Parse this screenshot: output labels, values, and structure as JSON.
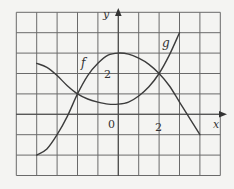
{
  "chart_data": {
    "type": "line",
    "title": "",
    "xlabel": "x",
    "ylabel": "y",
    "xlim": [
      -5,
      5
    ],
    "ylim": [
      -3,
      5
    ],
    "grid": true,
    "grid_step": 1,
    "tick_labels": {
      "origin": "0",
      "x": [
        {
          "value": 2,
          "label": "2"
        }
      ],
      "y": [
        {
          "value": 2,
          "label": "2"
        }
      ]
    },
    "series": [
      {
        "name": "f",
        "label_position": [
          -1.7,
          2.4
        ],
        "points": [
          [
            -4,
            -2
          ],
          [
            -3.5,
            -1.7
          ],
          [
            -3,
            -1
          ],
          [
            -2.5,
            -0.1
          ],
          [
            -2,
            1
          ],
          [
            -1.5,
            1.9
          ],
          [
            -1,
            2.5
          ],
          [
            -0.5,
            2.9
          ],
          [
            0,
            3
          ],
          [
            0.5,
            2.95
          ],
          [
            1,
            2.75
          ],
          [
            1.5,
            2.45
          ],
          [
            2,
            2
          ],
          [
            2.5,
            1.4
          ],
          [
            3,
            0.6
          ],
          [
            3.5,
            -0.2
          ],
          [
            4,
            -1
          ]
        ]
      },
      {
        "name": "g",
        "label_position": [
          2.3,
          3.4
        ],
        "points": [
          [
            -4,
            2.5
          ],
          [
            -3.5,
            2.3
          ],
          [
            -3,
            1.9
          ],
          [
            -2.5,
            1.4
          ],
          [
            -2,
            1
          ],
          [
            -1.5,
            0.75
          ],
          [
            -1,
            0.6
          ],
          [
            -0.5,
            0.5
          ],
          [
            0,
            0.5
          ],
          [
            0.5,
            0.6
          ],
          [
            1,
            0.9
          ],
          [
            1.5,
            1.35
          ],
          [
            2,
            2
          ],
          [
            2.5,
            2.9
          ],
          [
            3,
            4
          ]
        ]
      }
    ]
  },
  "labels": {
    "x_axis": "x",
    "y_axis": "y",
    "origin": "0",
    "x_tick": "2",
    "y_tick": "2",
    "f": "f",
    "g": "g"
  }
}
